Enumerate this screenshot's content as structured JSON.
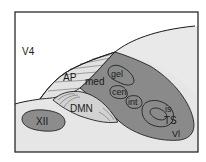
{
  "figure": {
    "type": "anatomical-section-diagram",
    "labels": {
      "v4": "V4",
      "ap": "AP",
      "med": "med",
      "gel": "gel",
      "cen": "cen",
      "int": "int",
      "is": "is",
      "ts": "TS",
      "vl": "Vl",
      "dmn": "DMN",
      "xii": "XII"
    },
    "colors": {
      "background": "#ffffff",
      "frame": "#2a2a2a",
      "upper_field": "#ffffff",
      "lower_field": "#e6e6e6",
      "dorsal_cap": "#e8e8e8",
      "nts_dark": "#8a8a8a",
      "ap_fill": "#e2e2e2",
      "dmn_fill": "#d2d2d2",
      "xii_fill": "#8c8c8c",
      "outline": "#222222"
    }
  }
}
